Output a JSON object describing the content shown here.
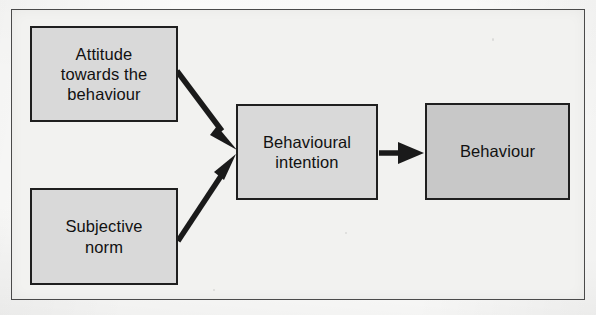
{
  "figure": {
    "background_color": "#f2f2f0",
    "frame_color": "#4a4a4a",
    "page_color": "#fdfdfc"
  },
  "nodes": [
    {
      "id": "attitude",
      "label": "Attitude\ntowards the\nbehaviour",
      "fill": "#d9d9d9",
      "border": "#1f1f1f"
    },
    {
      "id": "subjective-norm",
      "label": "Subjective\nnorm",
      "fill": "#d9d9d9",
      "border": "#1f1f1f"
    },
    {
      "id": "behavioural-intention",
      "label": "Behavioural\nintention",
      "fill": "#d9d9d9",
      "border": "#1f1f1f"
    },
    {
      "id": "behaviour",
      "label": "Behaviour",
      "fill": "#c8c8c8",
      "border": "#1f1f1f"
    }
  ],
  "arrows": [
    {
      "id": "attitude-to-intention",
      "from": "attitude",
      "to": "behavioural-intention",
      "direction": "diagonal-down-right",
      "color": "#1a1a1a"
    },
    {
      "id": "subjective-norm-to-intention",
      "from": "subjective-norm",
      "to": "behavioural-intention",
      "direction": "diagonal-up-right",
      "color": "#1a1a1a"
    },
    {
      "id": "intention-to-behaviour",
      "from": "behavioural-intention",
      "to": "behaviour",
      "direction": "horizontal-right",
      "color": "#1a1a1a"
    }
  ]
}
